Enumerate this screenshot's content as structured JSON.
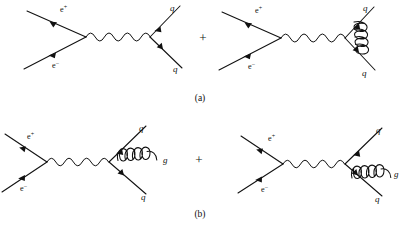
{
  "figure": {
    "background_color": "#ffffff",
    "ink_color": "#111111",
    "width": 400,
    "height": 230,
    "caption_a": "(a)",
    "caption_b": "(b)",
    "plus_sign": "+"
  },
  "labels": {
    "positron_base": "e",
    "positron_charge": "+",
    "electron_base": "e",
    "electron_charge": "−",
    "quark": "q",
    "antiquark": "q",
    "gluon": "g"
  },
  "panels": [
    {
      "id": "panel-a",
      "caption": "(a)",
      "caption_x": 200,
      "caption_y": 100,
      "plus_x": 203,
      "plus_y": 37,
      "diagrams": [
        {
          "id": "diagram-a1",
          "name": "ee-annihilation-to-qqbar-tree",
          "in_labels": [
            "e+",
            "e-"
          ],
          "out_labels": [
            "q",
            "q"
          ],
          "propagator": "photon",
          "loop": "none"
        },
        {
          "id": "diagram-a2",
          "name": "ee-annihilation-to-qqbar-gluon-vertex-correction",
          "in_labels": [
            "e+",
            "e-"
          ],
          "out_labels": [
            "q",
            "q"
          ],
          "propagator": "photon",
          "loop": "gluon-vertex-correction"
        }
      ]
    },
    {
      "id": "panel-b",
      "caption": "(b)",
      "caption_x": 200,
      "caption_y": 216,
      "plus_x": 199,
      "plus_y": 159,
      "diagrams": [
        {
          "id": "diagram-b1",
          "name": "ee-annihilation-to-qqbar-gluon-emission-upper",
          "in_labels": [
            "e+",
            "e-"
          ],
          "out_labels": [
            "q",
            "q",
            "g"
          ],
          "propagator": "photon",
          "loop": "none",
          "gluon_emitter": "upper-quark-leg"
        },
        {
          "id": "diagram-b2",
          "name": "ee-annihilation-to-qqbar-gluon-emission-lower",
          "in_labels": [
            "e+",
            "e-"
          ],
          "out_labels": [
            "q",
            "q",
            "g"
          ],
          "propagator": "photon",
          "loop": "none",
          "gluon_emitter": "lower-quark-leg"
        }
      ]
    }
  ],
  "text_positions": {
    "a1": {
      "eplus": {
        "x": 60,
        "y": 12
      },
      "eminus": {
        "x": 52,
        "y": 68
      },
      "q_up": {
        "x": 170,
        "y": 11
      },
      "q_down": {
        "x": 173,
        "y": 72
      }
    },
    "a2": {
      "eplus": {
        "x": 255,
        "y": 13
      },
      "eminus": {
        "x": 248,
        "y": 68
      },
      "q_up": {
        "x": 363,
        "y": 11
      },
      "q_down": {
        "x": 362,
        "y": 75
      }
    },
    "b1": {
      "eplus": {
        "x": 27,
        "y": 138
      },
      "eminus": {
        "x": 20,
        "y": 190
      },
      "q_up": {
        "x": 139,
        "y": 131
      },
      "q_down": {
        "x": 141,
        "y": 198
      },
      "gluon": {
        "x": 163,
        "y": 163
      }
    },
    "b2": {
      "eplus": {
        "x": 268,
        "y": 140
      },
      "eminus": {
        "x": 261,
        "y": 188
      },
      "q_up": {
        "x": 378,
        "y": 133
      },
      "q_down": {
        "x": 377,
        "y": 200
      },
      "gluon": {
        "x": 395,
        "y": 175
      }
    }
  }
}
